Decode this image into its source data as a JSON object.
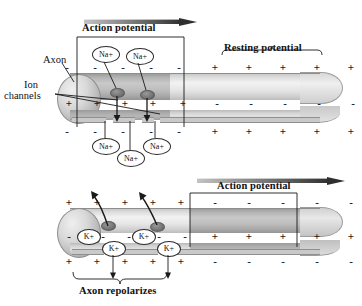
{
  "figure": {
    "ink": "#1a1a1a",
    "arrow_light": "#b6b6b6",
    "arrow_dark": "#3a3a3a"
  },
  "panel_top": {
    "motion_label": "Action potential",
    "resting_label": "Resting potential",
    "axon_label": "Axon",
    "ion_channels_label": "Ion\nchannels",
    "ion_channels_line1": "Ion",
    "ion_channels_line2": "channels",
    "ions_outside": [
      {
        "label": "Na+",
        "x": 97,
        "y": 48
      },
      {
        "label": "Na+",
        "x": 131,
        "y": 50
      }
    ],
    "ions_inside": [
      {
        "label": "Na+",
        "x": 97,
        "y": 140
      },
      {
        "label": "Na+",
        "x": 122,
        "y": 150
      },
      {
        "label": "Na+",
        "x": 148,
        "y": 140
      }
    ],
    "charges_outer_top": [
      "-",
      "-",
      "-",
      "-",
      "-",
      "+",
      "+",
      "+",
      "+",
      "+"
    ],
    "charges_inner": [
      "+",
      "+",
      "+",
      "+",
      "+",
      "-",
      "-",
      "-",
      "-",
      "-"
    ],
    "charges_outer_bottom": [
      "-",
      "-",
      "-",
      "-",
      "-",
      "+",
      "+",
      "+",
      "+",
      "+"
    ],
    "depolarized_span_cells": 5
  },
  "panel_bottom": {
    "motion_label": "Action potential",
    "repolarize_label": "Axon repolarizes",
    "ions_on_membrane": [
      {
        "label": "K+",
        "x": 83,
        "y": 228
      },
      {
        "label": "K+",
        "x": 136,
        "y": 228
      }
    ],
    "ions_below": [
      {
        "label": "K+",
        "x": 108,
        "y": 244
      },
      {
        "label": "K+",
        "x": 162,
        "y": 244
      }
    ],
    "charges_outer_top": [
      "+",
      "+",
      "+",
      "+",
      "+",
      "-",
      "-",
      "-",
      "-",
      "-"
    ],
    "charges_inner": [
      "-",
      "-",
      "-",
      "-",
      "-",
      "+",
      "+",
      "+",
      "+",
      "+"
    ],
    "charges_outer_bottom": [
      "+",
      "+",
      "+",
      "+",
      "+",
      "-",
      "-",
      "-",
      "-",
      "-"
    ],
    "depolarized_span_cells": 5
  }
}
